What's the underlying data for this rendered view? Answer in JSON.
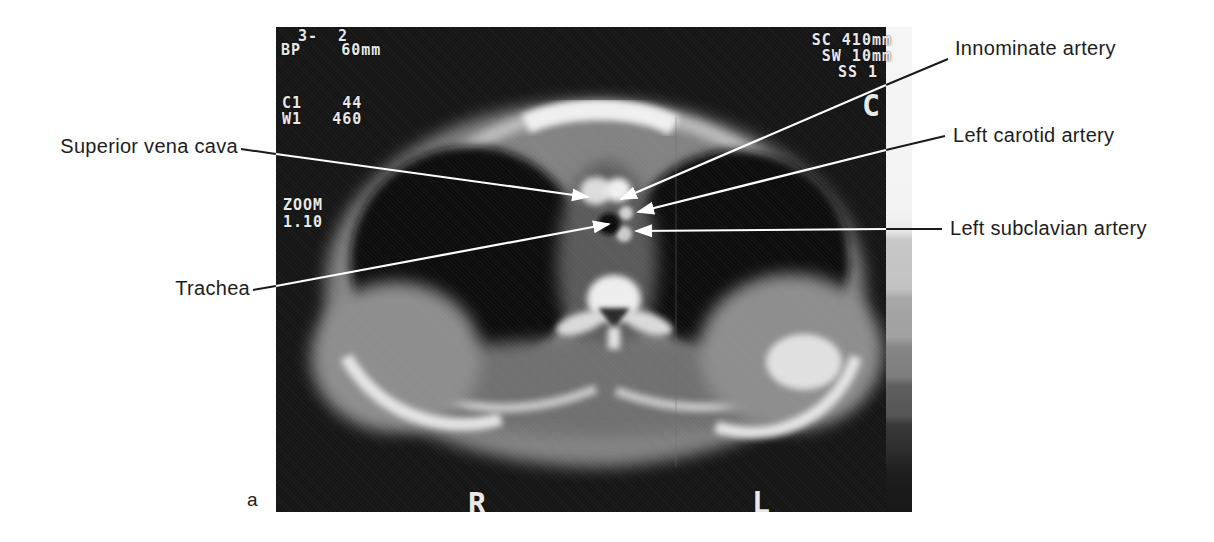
{
  "figure": {
    "panel_letter": "a"
  },
  "ct_scan": {
    "overlay": {
      "study_line": "3-  2",
      "bp_line": "BP    60mm",
      "center_line": "C1    44",
      "window_line": "W1   460",
      "zoom_label": "ZOOM",
      "zoom_value": "1.10",
      "scan_field": "SC 410mm",
      "slice_width": "SW 10mm",
      "slice_number": "SS 1",
      "orientation_letter": "C",
      "marker_right": "R",
      "marker_left": "L"
    },
    "colors": {
      "film_background": "#161616",
      "overlay_text": "#e8e8e6",
      "annotation_line_inside": "#ffffff",
      "annotation_line_outside": "#1a1a1a",
      "label_text": "#1d1d1d"
    }
  },
  "annotations": {
    "superior_vena_cava": "Superior vena cava",
    "trachea": "Trachea",
    "innominate_artery": "Innominate artery",
    "left_carotid_artery": "Left carotid artery",
    "left_subclavian_artery": "Left subclavian artery"
  }
}
